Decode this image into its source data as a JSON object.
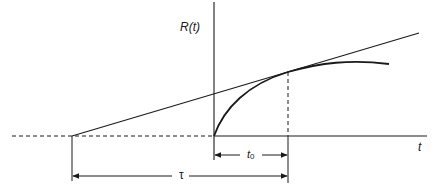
{
  "diagram": {
    "type": "step-response-tangent-construction",
    "axes": {
      "y_label": "R(t)",
      "x_label": "t"
    },
    "annotations": {
      "t0_label_base": "t",
      "t0_label_sub": "0",
      "tau_label": "τ"
    },
    "elements": [
      {
        "id": "y-axis",
        "description": "vertical axis at origin"
      },
      {
        "id": "x-axis",
        "description": "horizontal t axis, dashed to the left of origin"
      },
      {
        "id": "response-curve",
        "description": "R(t) rising from origin and leveling off"
      },
      {
        "id": "tangent-line",
        "description": "tangent to R(t) at t0, intersecting t-axis at -τ+t0"
      },
      {
        "id": "t0-marker",
        "description": "dashed vertical at tangent point t0"
      },
      {
        "id": "t0-dimension",
        "description": "interval from origin to t0"
      },
      {
        "id": "tau-dimension",
        "description": "interval from tangent intercept to t0"
      }
    ],
    "colors": {
      "stroke": "#1a1a1a",
      "background": "#ffffff"
    }
  }
}
